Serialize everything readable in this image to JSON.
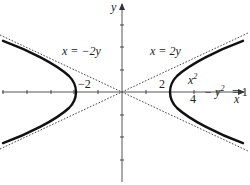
{
  "figure": {
    "type": "hyperbola-with-asymptotes",
    "axes": {
      "x_label": "x",
      "y_label": "y",
      "origin_px": [
        122,
        92
      ],
      "x_scale_px_per_unit": 24,
      "y_scale_px_per_unit": 22.5,
      "x_ticks": [
        -5,
        -4,
        -3,
        -2,
        -1,
        1,
        2,
        3,
        4
      ],
      "y_ticks": [
        -3,
        -2,
        -1,
        1,
        2,
        3
      ]
    },
    "curve": {
      "equation_numerator": "x",
      "equation_numerator_exp": "2",
      "equation_denominator": "4",
      "equation_minus": "− y",
      "equation_minus_exp": "2",
      "equation_rhs": "= 1",
      "a": 2,
      "b": 1
    },
    "asymptotes": [
      {
        "label": "x = −2y",
        "slope": -0.5
      },
      {
        "label": "x = 2y",
        "slope": 0.5
      }
    ],
    "vertex_labels": {
      "left": "−2",
      "right": "2"
    },
    "colors": {
      "curve": "#111111",
      "asymptote": "#333333",
      "axis": "#555555",
      "background": "#ffffff"
    }
  }
}
